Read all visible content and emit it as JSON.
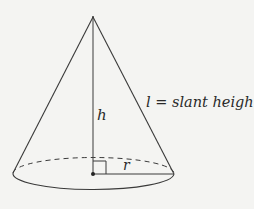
{
  "diagram": {
    "labels": {
      "height": "h",
      "radius": "r",
      "slant_height": "l = slant height"
    },
    "colors": {
      "background": "#f4f4f2",
      "stroke": "#3a3a3a",
      "text": "#2a2a2a"
    },
    "geometry": {
      "apex": [
        93,
        17
      ],
      "base_center": [
        93,
        174
      ],
      "base_left": [
        13,
        173
      ],
      "base_right": [
        174,
        174
      ],
      "base_ellipse_ry": 16,
      "right_angle_marker_size": 13
    }
  }
}
